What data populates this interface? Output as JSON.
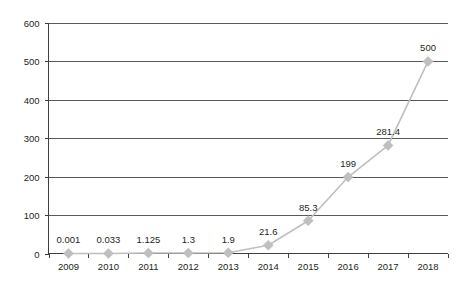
{
  "chart_data": {
    "type": "line",
    "title": "",
    "subtitle": "",
    "xlabel": "",
    "ylabel": "",
    "categories": [
      "2009",
      "2010",
      "2011",
      "2012",
      "2013",
      "2014",
      "2015",
      "2016",
      "2017",
      "2018"
    ],
    "values": [
      0.001,
      0.033,
      1.125,
      1.3,
      1.9,
      21.6,
      85.3,
      199,
      281.4,
      500
    ],
    "data_labels": [
      "0.001",
      "0.033",
      "1.125",
      "1.3",
      "1.9",
      "21.6",
      "85.3",
      "199",
      "281.4",
      "500"
    ],
    "series": [
      {
        "name": "",
        "values": [
          0.001,
          0.033,
          1.125,
          1.3,
          1.9,
          21.6,
          85.3,
          199,
          281.4,
          500
        ]
      }
    ],
    "ylim": [
      0,
      600
    ],
    "y_ticks": [
      0,
      100,
      200,
      300,
      400,
      500,
      600
    ],
    "y_tick_labels": [
      "0",
      "100",
      "200",
      "300",
      "400",
      "500",
      "600"
    ],
    "grid": true,
    "grid_axis": "y",
    "legend": false,
    "legend_position": "none",
    "marker": "diamond",
    "colors": {
      "line": "#bfbfbf",
      "marker": "#bfbfbf",
      "gridline": "#58595b",
      "axis": "#3f3f3f",
      "text": "#231f20",
      "background": "#ffffff"
    }
  },
  "axes": {
    "y_axis_name": "value-axis",
    "x_axis_name": "category-axis"
  }
}
